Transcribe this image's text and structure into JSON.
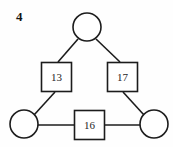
{
  "figure": {
    "label": "4",
    "type": "weighted-graph-diagram",
    "background_color": "#fefefe",
    "stroke_color": "#1c1c1c",
    "fill_color": "#ffffff"
  },
  "nodes": [
    {
      "id": "top",
      "name": "node-top",
      "cx": 87,
      "cy": 27,
      "r": 14
    },
    {
      "id": "bottom-left",
      "name": "node-bottom-left",
      "cx": 24,
      "cy": 124,
      "r": 14
    },
    {
      "id": "bottom-right",
      "name": "node-bottom-right",
      "cx": 154,
      "cy": 124,
      "r": 14
    }
  ],
  "edges": [
    {
      "id": "edge-left",
      "from": "top",
      "to": "bottom-left",
      "label": "13",
      "box": {
        "x": 41,
        "y": 62,
        "w": 31,
        "h": 30
      },
      "segments": [
        {
          "x1": 78,
          "y1": 39,
          "x2": 58,
          "y2": 62
        },
        {
          "x1": 55,
          "y1": 92,
          "x2": 34,
          "y2": 115
        }
      ]
    },
    {
      "id": "edge-right",
      "from": "top",
      "to": "bottom-right",
      "label": "17",
      "box": {
        "x": 107,
        "y": 62,
        "w": 31,
        "h": 30
      },
      "segments": [
        {
          "x1": 96,
          "y1": 39,
          "x2": 120,
          "y2": 62
        },
        {
          "x1": 123,
          "y1": 92,
          "x2": 144,
          "y2": 115
        }
      ]
    },
    {
      "id": "edge-bottom",
      "from": "bottom-left",
      "to": "bottom-right",
      "label": "16",
      "box": {
        "x": 74,
        "y": 110,
        "w": 31,
        "h": 30
      },
      "segments": [
        {
          "x1": 38,
          "y1": 125,
          "x2": 74,
          "y2": 125
        },
        {
          "x1": 105,
          "y1": 125,
          "x2": 140,
          "y2": 125
        }
      ]
    }
  ]
}
